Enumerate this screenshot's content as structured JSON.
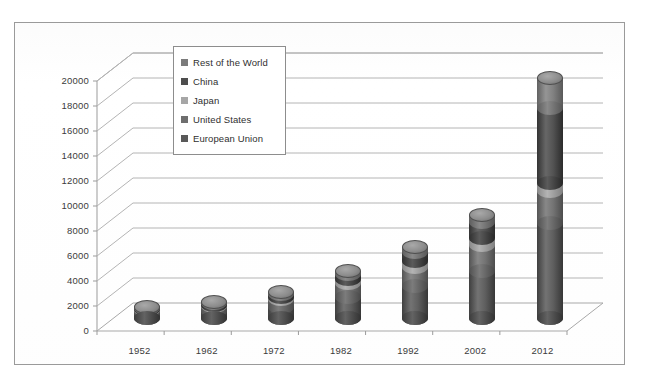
{
  "chart_data": {
    "type": "bar",
    "subtype": "stacked-3d-cylinder",
    "title": "",
    "xlabel": "",
    "ylabel": "",
    "categories": [
      "1952",
      "1962",
      "1972",
      "1982",
      "1992",
      "2002",
      "2012"
    ],
    "ylim": [
      0,
      20000
    ],
    "ytick_step": 2000,
    "ytick_labels": [
      "0",
      "2000",
      "4000",
      "6000",
      "8000",
      "10000",
      "12000",
      "14000",
      "16000",
      "18000",
      "20000"
    ],
    "grid": true,
    "legend_position": "inside-top-left",
    "series": [
      {
        "name": "European Union",
        "color": "#595959",
        "values": [
          430,
          600,
          950,
          1700,
          2600,
          3800,
          7600
        ]
      },
      {
        "name": "United States",
        "color": "#6e6e6e",
        "values": [
          270,
          380,
          600,
          1100,
          1500,
          2050,
          2600
        ]
      },
      {
        "name": "Japan",
        "color": "#a6a6a6",
        "values": [
          60,
          110,
          200,
          330,
          480,
          560,
          600
        ]
      },
      {
        "name": "China",
        "color": "#4d4d4d",
        "values": [
          70,
          110,
          200,
          420,
          700,
          1300,
          6000
        ]
      },
      {
        "name": "Rest of the World",
        "color": "#7b7b7b",
        "values": [
          70,
          100,
          150,
          250,
          420,
          590,
          2400
        ]
      }
    ],
    "totals": [
      900,
      1300,
      2100,
      3800,
      5700,
      8300,
      19200
    ]
  },
  "legend": {
    "items": [
      {
        "label": "Rest of the World",
        "color": "#7b7b7b"
      },
      {
        "label": "China",
        "color": "#4d4d4d"
      },
      {
        "label": "Japan",
        "color": "#a6a6a6"
      },
      {
        "label": "United States",
        "color": "#6e6e6e"
      },
      {
        "label": "European Union",
        "color": "#595959"
      }
    ]
  },
  "axes": {
    "y_ticks": [
      "20000",
      "18000",
      "16000",
      "14000",
      "12000",
      "10000",
      "8000",
      "6000",
      "4000",
      "2000",
      "0"
    ],
    "x_ticks": [
      "1952",
      "1962",
      "1972",
      "1982",
      "1992",
      "2002",
      "2012"
    ]
  }
}
